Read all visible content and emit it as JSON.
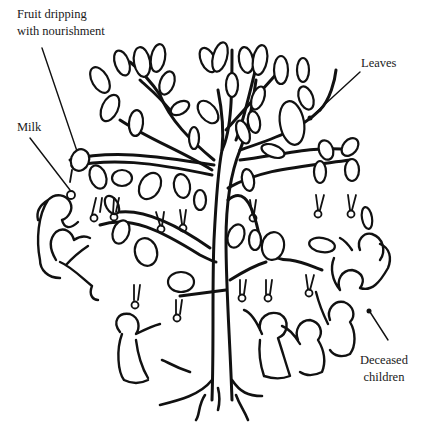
{
  "figure": {
    "type": "line-art illustration",
    "labels": {
      "fruit": [
        "Fruit dripping",
        "with nourishment"
      ],
      "leaves": "Leaves",
      "milk": "Milk",
      "deceased": [
        "Deceased",
        "children"
      ]
    },
    "colors": {
      "ink": "#111111",
      "background": "#ffffff"
    }
  }
}
